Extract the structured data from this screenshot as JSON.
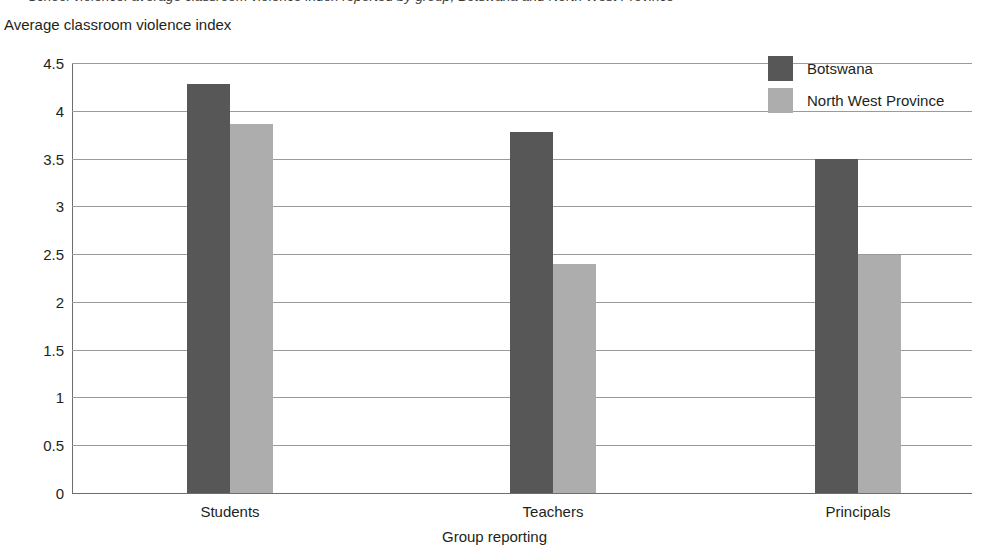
{
  "title_sliver": "School violence: average classroom violence index reported by group, Botswana and North West Province",
  "chart_data": {
    "type": "bar",
    "title": "",
    "xlabel": "Group reporting",
    "ylabel": "Average classroom violence index",
    "categories": [
      "Students",
      "Teachers",
      "Principals"
    ],
    "series": [
      {
        "name": "Botswana",
        "color": "#575757",
        "values": [
          4.28,
          3.78,
          3.5
        ]
      },
      {
        "name": "North West Province",
        "color": "#adadad",
        "values": [
          3.86,
          2.4,
          2.49
        ]
      }
    ],
    "ylim": [
      0,
      4.5
    ],
    "yticks": [
      "4.5",
      "4",
      "3.5",
      "3",
      "2.5",
      "2",
      "1.5",
      "1",
      "0.5",
      "0"
    ],
    "ytick_values": [
      4.5,
      4,
      3.5,
      3,
      2.5,
      2,
      1.5,
      1,
      0.5,
      0
    ],
    "grid": true,
    "legend_position": "top-right"
  },
  "legend": {
    "items": [
      {
        "label": "Botswana",
        "color": "#575757"
      },
      {
        "label": "North West Province",
        "color": "#adadad"
      }
    ]
  }
}
